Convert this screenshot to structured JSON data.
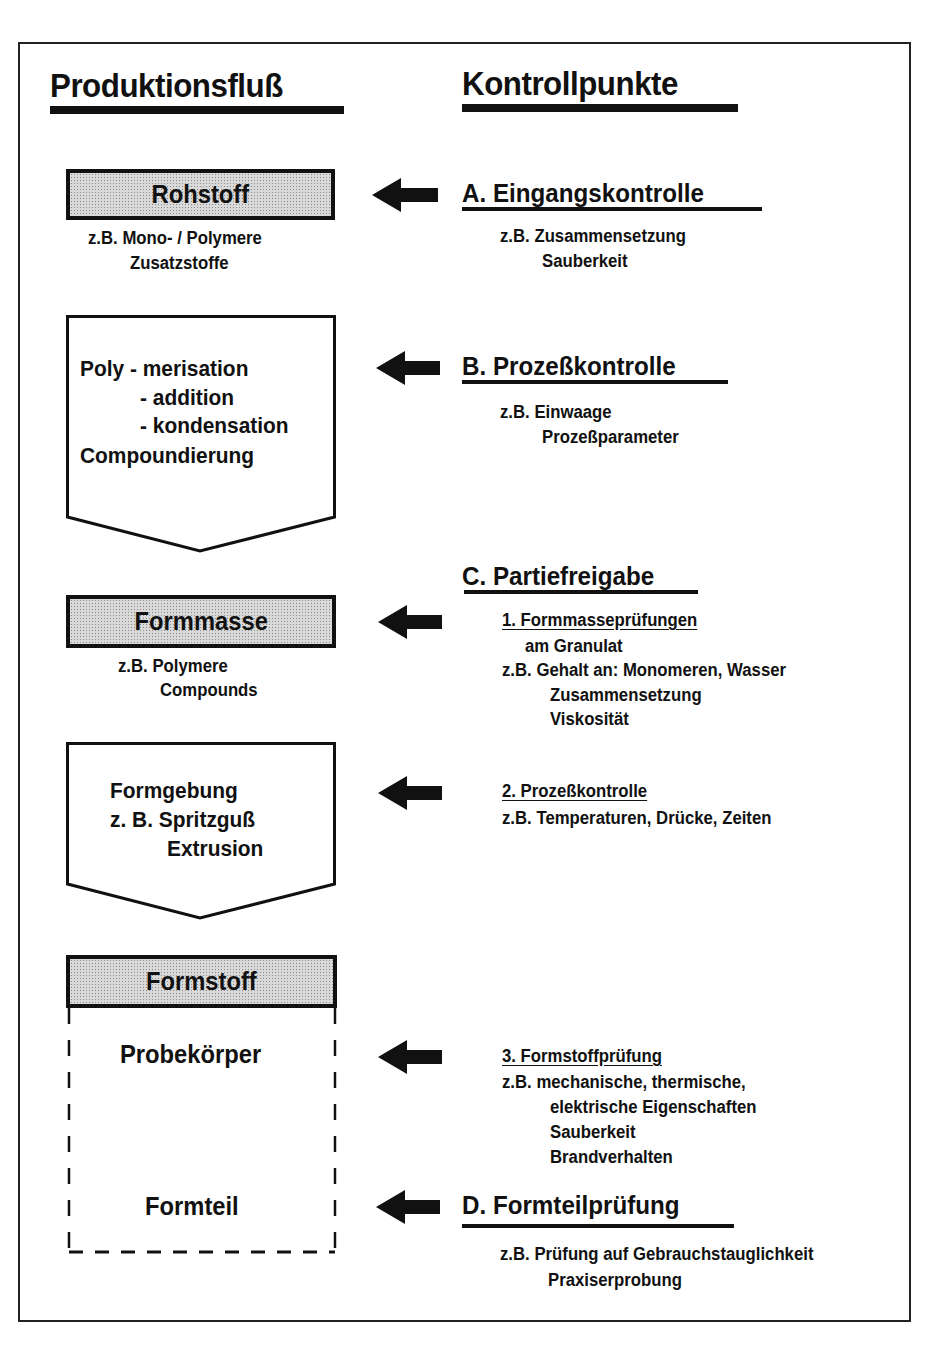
{
  "headings": {
    "production_flow": "Produktionsfluß",
    "control_points": "Kontrollpunkte"
  },
  "flow": {
    "rohstoff": {
      "label": "Rohstoff",
      "examples": [
        "z.B. Mono- / Polymere",
        "Zusatzstoffe"
      ]
    },
    "process1": {
      "lines": [
        "Poly - merisation",
        "- addition",
        "- kondensation",
        "Compoundierung"
      ]
    },
    "formmasse": {
      "label": "Formmasse",
      "examples": [
        "z.B. Polymere",
        "Compounds"
      ]
    },
    "process2": {
      "lines": [
        "Formgebung",
        "z. B. Spritzguß",
        "Extrusion"
      ]
    },
    "formstoff": {
      "label": "Formstoff",
      "items": [
        "Probekörper",
        "Formteil"
      ]
    }
  },
  "controls": {
    "A": {
      "title": "A. Eingangskontrolle",
      "examples": [
        "z.B. Zusammensetzung",
        "Sauberkeit"
      ]
    },
    "B": {
      "title": "B. Prozeßkontrolle",
      "examples": [
        "z.B. Einwaage",
        "Prozeßparameter"
      ]
    },
    "C": {
      "title": "C. Partiefreigabe",
      "sub1": {
        "title": "1. Formmasseprüfungen",
        "lines": [
          "am Granulat",
          "z.B. Gehalt an: Monomeren, Wasser",
          "Zusammensetzung",
          "Viskosität"
        ]
      },
      "sub2": {
        "title": "2. Prozeßkontrolle",
        "lines": [
          "z.B. Temperaturen, Drücke, Zeiten"
        ]
      },
      "sub3": {
        "title": "3. Formstoffprüfung",
        "lines": [
          "z.B. mechanische, thermische,",
          "elektrische Eigenschaften",
          "Sauberkeit",
          "Brandverhalten"
        ]
      }
    },
    "D": {
      "title": "D. Formteilprüfung",
      "examples": [
        "z.B. Prüfung auf Gebrauchstauglichkeit",
        "Praxiserprobung"
      ]
    }
  },
  "colors": {
    "ink": "#111111",
    "box_fill": "#d9d9d9",
    "background": "#ffffff"
  }
}
